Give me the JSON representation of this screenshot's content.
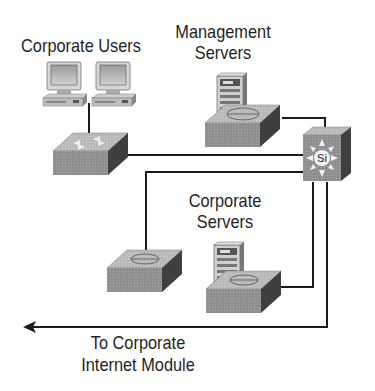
{
  "diagram": {
    "labels": {
      "corporate_users": "Corporate Users",
      "management_servers_line1": "Management",
      "management_servers_line2": "Servers",
      "corporate_servers_line1": "Corporate",
      "corporate_servers_line2": "Servers",
      "internet_module_line1": "To Corporate",
      "internet_module_line2": "Internet Module"
    },
    "core_switch": {
      "icon_text": "Si"
    },
    "nodes": [
      {
        "id": "user-pc-1",
        "type": "workstation"
      },
      {
        "id": "user-pc-2",
        "type": "workstation"
      },
      {
        "id": "user-switch",
        "type": "switch"
      },
      {
        "id": "mgmt-server",
        "type": "server"
      },
      {
        "id": "mgmt-switch",
        "type": "switch"
      },
      {
        "id": "core-switch",
        "type": "layer3-switch"
      },
      {
        "id": "left-switch",
        "type": "switch"
      },
      {
        "id": "corp-server",
        "type": "server"
      },
      {
        "id": "corp-server-switch",
        "type": "switch"
      }
    ],
    "colors": {
      "line": "#1a1a1a",
      "switch_top": "#b8b8b8",
      "switch_front": "#8a8a8a",
      "switch_side": "#4a4a4a",
      "text": "#1f1f1f"
    }
  }
}
